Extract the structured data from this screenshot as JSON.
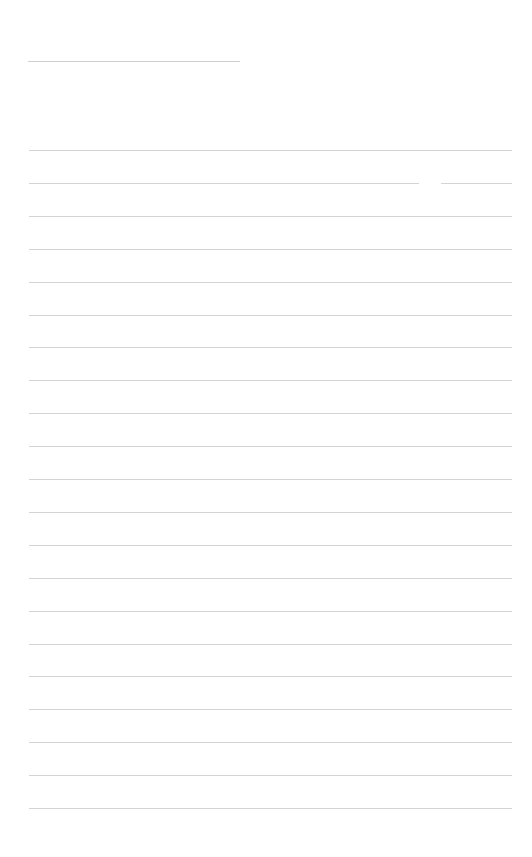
{
  "page": {
    "type": "blank lined sheet",
    "background": "#ffffff",
    "line_color": "#d4d4d4",
    "title_line": {
      "text": ""
    },
    "ruled_line_count": 21,
    "ruled_lines_text": [
      "",
      "",
      "",
      "",
      "",
      "",
      "",
      "",
      "",
      "",
      "",
      "",
      "",
      "",
      "",
      "",
      "",
      "",
      "",
      "",
      ""
    ]
  }
}
